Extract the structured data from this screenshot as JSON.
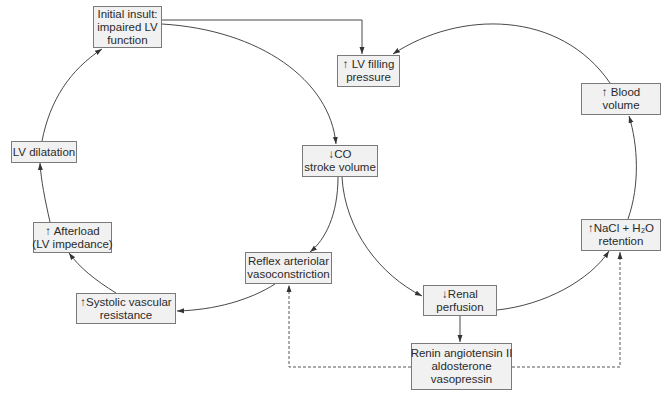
{
  "diagram": {
    "type": "flowchart",
    "nodes": [
      {
        "id": "initial",
        "lines": [
          "Initial insult:",
          "impaired LV",
          "function"
        ]
      },
      {
        "id": "lvfill",
        "lines": [
          "↑ LV filling",
          "pressure"
        ]
      },
      {
        "id": "blood",
        "lines": [
          "↑ Blood",
          "volume"
        ]
      },
      {
        "id": "lvdil",
        "lines": [
          "LV dilatation"
        ]
      },
      {
        "id": "co",
        "lines": [
          "↓CO",
          "stroke volume"
        ]
      },
      {
        "id": "afterload",
        "lines": [
          "↑ Afterload",
          "(LV impedance)"
        ]
      },
      {
        "id": "reflex",
        "lines": [
          "Reflex arteriolar",
          "vasoconstriction"
        ]
      },
      {
        "id": "systolic",
        "lines": [
          "↑Systolic vascular",
          "resistance"
        ]
      },
      {
        "id": "nacl",
        "lines": [
          "↑NaCl + H₂O",
          "retention"
        ]
      },
      {
        "id": "renal",
        "lines": [
          "↓Renal",
          "perfusion"
        ]
      },
      {
        "id": "renin",
        "lines": [
          "Renin angiotensin II",
          "aldosterone",
          "vasopressin"
        ]
      }
    ],
    "edges": [
      {
        "from": "initial",
        "to": "lvfill",
        "style": "solid"
      },
      {
        "from": "initial",
        "to": "co",
        "style": "solid"
      },
      {
        "from": "co",
        "to": "reflex",
        "style": "solid"
      },
      {
        "from": "reflex",
        "to": "systolic",
        "style": "solid"
      },
      {
        "from": "systolic",
        "to": "afterload",
        "style": "solid"
      },
      {
        "from": "afterload",
        "to": "lvdil",
        "style": "solid"
      },
      {
        "from": "lvdil",
        "to": "initial",
        "style": "solid"
      },
      {
        "from": "co",
        "to": "renal",
        "style": "solid"
      },
      {
        "from": "renal",
        "to": "nacl",
        "style": "solid"
      },
      {
        "from": "nacl",
        "to": "blood",
        "style": "solid"
      },
      {
        "from": "blood",
        "to": "lvfill",
        "style": "solid"
      },
      {
        "from": "renal",
        "to": "renin",
        "style": "solid"
      },
      {
        "from": "renin",
        "to": "reflex",
        "style": "dashed"
      },
      {
        "from": "renin",
        "to": "nacl",
        "style": "dashed"
      }
    ]
  },
  "colors": {
    "box_fill": "#f1f1f1",
    "box_border": "#7a7a7a",
    "line": "#333333"
  }
}
